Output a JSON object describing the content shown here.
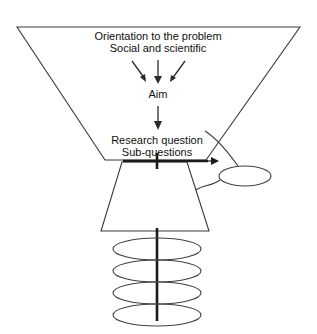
{
  "diagram": {
    "background_color": "#ffffff",
    "line_color": "#3a3a3a",
    "text_color": "#101010",
    "labels": {
      "orientation_line1": "Orientation to the problem",
      "orientation_line2": "Social and scientific",
      "aim": "Aim",
      "research_question_line1": "Research question",
      "research_question_line2": "Sub-questions"
    },
    "shapes": {
      "funnel": {
        "name": "large-inverted-trapezoid",
        "top_left_x": 17,
        "top_right_x": 300,
        "top_y": 27,
        "bottom_left_x": 105,
        "bottom_right_x": 206,
        "bottom_y": 160
      },
      "lower_trapezoid": {
        "name": "small-trapezoid",
        "top_left_x": 122,
        "top_right_x": 187,
        "top_y": 162,
        "bottom_left_x": 101,
        "bottom_right_x": 209,
        "bottom_y": 231
      },
      "side_ellipse": {
        "name": "side-ellipse",
        "cx": 245,
        "cy": 176,
        "rx": 26,
        "ry": 10
      },
      "stacked_ellipses": {
        "count": 4,
        "cx": 157,
        "rx": 44,
        "ry": 11,
        "cy_values": [
          249,
          271,
          293,
          315
        ]
      }
    },
    "connectors": {
      "converging_arrows": 3,
      "aim_to_question_arrow": 1,
      "horizontal_thick_arrow": {
        "from_x": 122,
        "to_x": 216,
        "y": 161,
        "tick_x": 157
      },
      "curve_top_to_ellipse": "research-question-to-side-ellipse",
      "curve_ellipse_to_trapezoid": "side-ellipse-to-lower-trapezoid"
    }
  }
}
